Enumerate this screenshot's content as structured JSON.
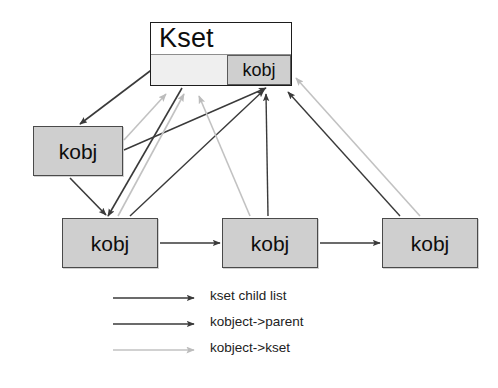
{
  "diagram": {
    "nodes": [
      {
        "id": "kset",
        "label": "Kset",
        "inner_label": "kobj",
        "x": 150,
        "y": 22,
        "w": 142,
        "h": 64
      },
      {
        "id": "kobj_left",
        "label": "kobj",
        "x": 33,
        "y": 126,
        "w": 90,
        "h": 50
      },
      {
        "id": "kobj_b1",
        "label": "kobj",
        "x": 62,
        "y": 218,
        "w": 96,
        "h": 50
      },
      {
        "id": "kobj_b2",
        "label": "kobj",
        "x": 222,
        "y": 218,
        "w": 96,
        "h": 50
      },
      {
        "id": "kobj_b3",
        "label": "kobj",
        "x": 382,
        "y": 218,
        "w": 96,
        "h": 50
      }
    ],
    "colors": {
      "child_list": "#3a3a3a",
      "parent": "#3a3a3a",
      "kset_ref": "#c2c2c2",
      "node_fill": "#cfcfcf",
      "node_border": "#4a4a4a",
      "kset_fill": "#ffffff",
      "kset_band": "#efefef",
      "background": "#ffffff",
      "text": "#0d0d0d"
    },
    "legend": {
      "rows": [
        {
          "id": "child-list",
          "label": "kset child list",
          "color": "#3a3a3a",
          "width": 1.6
        },
        {
          "id": "parent",
          "label": "kobject->parent",
          "color": "#3a3a3a",
          "width": 1.4
        },
        {
          "id": "kset-ref",
          "label": "kobject->kset",
          "color": "#c2c2c2",
          "width": 1.6
        }
      ]
    },
    "edges": [
      {
        "id": "kset-to-kobjleft",
        "type": "child_list",
        "x1": 158,
        "y1": 65,
        "x2": 80,
        "y2": 124
      },
      {
        "id": "kset-to-kobjb1",
        "type": "child_list",
        "x1": 182,
        "y1": 88,
        "x2": 108,
        "y2": 216
      },
      {
        "id": "kobjleft-to-kobjb1",
        "type": "child_list",
        "x1": 70,
        "y1": 178,
        "x2": 106,
        "y2": 215
      },
      {
        "id": "kobjb1-to-kobjb2",
        "type": "child_list",
        "x1": 160,
        "y1": 243,
        "x2": 220,
        "y2": 243
      },
      {
        "id": "kobjb2-to-kobjb3",
        "type": "child_list",
        "x1": 320,
        "y1": 243,
        "x2": 380,
        "y2": 243
      },
      {
        "id": "kobjleft-parent",
        "type": "parent",
        "x1": 124,
        "y1": 150,
        "x2": 266,
        "y2": 88
      },
      {
        "id": "kobjb1-parent",
        "type": "parent",
        "x1": 130,
        "y1": 216,
        "x2": 264,
        "y2": 90
      },
      {
        "id": "kobjb2-parent",
        "type": "parent",
        "x1": 268,
        "y1": 216,
        "x2": 266,
        "y2": 94
      },
      {
        "id": "kobjb3-parent",
        "type": "parent",
        "x1": 400,
        "y1": 216,
        "x2": 288,
        "y2": 92
      },
      {
        "id": "kobjleft-kset",
        "type": "kset_ref",
        "x1": 124,
        "y1": 140,
        "x2": 166,
        "y2": 94
      },
      {
        "id": "kobjb1-kset",
        "type": "kset_ref",
        "x1": 118,
        "y1": 216,
        "x2": 184,
        "y2": 94
      },
      {
        "id": "kobjb2-kset",
        "type": "kset_ref",
        "x1": 250,
        "y1": 216,
        "x2": 199,
        "y2": 96
      },
      {
        "id": "kobjb3-kset",
        "type": "kset_ref",
        "x1": 420,
        "y1": 216,
        "x2": 296,
        "y2": 78
      }
    ]
  }
}
